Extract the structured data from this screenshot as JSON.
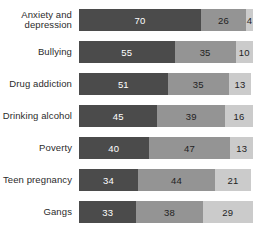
{
  "chart_data": {
    "type": "bar",
    "subtype": "stacked-horizontal-100",
    "title": "",
    "subtitle": "",
    "xlabel": "",
    "ylabel": "",
    "xlim": [
      0,
      100
    ],
    "grid": false,
    "legend": "none",
    "categories": [
      "Anxiety and\ndepression",
      "Bullying",
      "Drug addiction",
      "Drinking alcohol",
      "Poverty",
      "Teen pregnancy",
      "Gangs"
    ],
    "series": [
      {
        "name": "series-1",
        "color": "#4b4b4b",
        "values": [
          70,
          55,
          51,
          45,
          40,
          34,
          33
        ]
      },
      {
        "name": "series-2",
        "color": "#949494",
        "values": [
          26,
          35,
          35,
          39,
          47,
          44,
          38
        ]
      },
      {
        "name": "series-3",
        "color": "#cbcbcb",
        "values": [
          4,
          10,
          13,
          16,
          13,
          21,
          29
        ]
      }
    ]
  },
  "colors": {
    "background": "#ffffff",
    "segment_dark": "#4b4b4b",
    "segment_medium": "#949494",
    "segment_light": "#cbcbcb",
    "label_text": "#2b2b2b",
    "value_text_on_dark": "#ffffff",
    "value_text_on_light": "#1f1f1f"
  }
}
